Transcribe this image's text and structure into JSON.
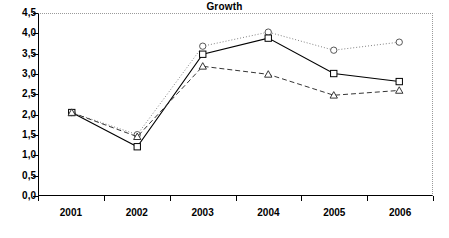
{
  "chart_data": {
    "type": "line",
    "title": "Growth",
    "xlabel": "",
    "ylabel": "",
    "categories": [
      "2001",
      "2002",
      "2003",
      "2004",
      "2005",
      "2006"
    ],
    "ylim": [
      0.0,
      4.5
    ],
    "yticks": [
      0.0,
      0.5,
      1.0,
      1.5,
      2.0,
      2.5,
      3.0,
      3.5,
      4.0,
      4.5
    ],
    "ytick_labels": [
      "0,0",
      "0,5",
      "1,0",
      "1,5",
      "2,0",
      "2,5",
      "3,0",
      "3,5",
      "4,0",
      "4,5"
    ],
    "decimal_separator": ",",
    "grid": false,
    "legend": "none",
    "series": [
      {
        "name": "series-circle",
        "marker": "circle",
        "line_style": "dotted",
        "color": "#808080",
        "values": [
          2.05,
          1.5,
          3.7,
          4.05,
          3.6,
          3.8
        ]
      },
      {
        "name": "series-square",
        "marker": "square",
        "line_style": "solid",
        "color": "#000000",
        "values": [
          2.05,
          1.2,
          3.5,
          3.9,
          3.02,
          2.82
        ]
      },
      {
        "name": "series-triangle",
        "marker": "triangle",
        "line_style": "dashed",
        "color": "#333333",
        "values": [
          2.05,
          1.45,
          3.2,
          3.0,
          2.48,
          2.6
        ]
      }
    ]
  },
  "plot": {
    "border_color": "#000000",
    "frame_dotted_color": "#9a9a9a",
    "background": "#ffffff"
  }
}
